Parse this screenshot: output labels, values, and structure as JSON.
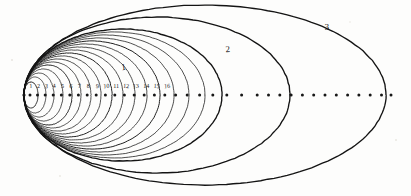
{
  "figure": {
    "background_color": "#fdfdfc",
    "ink_color": "#141414",
    "width": 411,
    "height": 196
  },
  "focus": {
    "label": "common-focus",
    "x": 24,
    "y": 95
  },
  "axis": {
    "label": "major-axis",
    "y": 95,
    "start_x": 24,
    "end_x": 392,
    "dot_radius": 1.5,
    "dot_positions": [
      30,
      37.5,
      45.2,
      53.2,
      61.4,
      69.8,
      78.4,
      87.2,
      96.2,
      105.4,
      114.8,
      124.4,
      134.2,
      144.2,
      154.4,
      164.8,
      175.6,
      187.2,
      199.6,
      212.8,
      226.8,
      241.6,
      257.2,
      268.5,
      279.8,
      291.1,
      302.4,
      313.7,
      325.0,
      336.3,
      347.6,
      358.9,
      370.2,
      381.5,
      391.0
    ]
  },
  "tick_numbers": {
    "label": "axis-tick-numbers",
    "y": 88,
    "items": [
      {
        "text": "1",
        "x": 31.0
      },
      {
        "text": "2",
        "x": 38.4
      },
      {
        "text": "3",
        "x": 46.2
      },
      {
        "text": "4",
        "x": 54.2
      },
      {
        "text": "5",
        "x": 62.4
      },
      {
        "text": "6",
        "x": 70.8
      },
      {
        "text": "7",
        "x": 79.4
      },
      {
        "text": "8",
        "x": 88.2
      },
      {
        "text": "9",
        "x": 97.2
      },
      {
        "text": "10",
        "x": 106.6
      },
      {
        "text": "11",
        "x": 116.2
      },
      {
        "text": "12",
        "x": 126.0
      },
      {
        "text": "13",
        "x": 136.0
      },
      {
        "text": "14",
        "x": 146.2
      },
      {
        "text": "15",
        "x": 156.6
      },
      {
        "text": "16",
        "x": 167.2
      }
    ]
  },
  "curve_labels": {
    "label": "curve-annotations",
    "items": [
      {
        "text": "1",
        "x": 124,
        "y": 70,
        "name": "curve-label-1"
      },
      {
        "text": "2",
        "x": 228,
        "y": 52,
        "name": "curve-label-2"
      },
      {
        "text": "3",
        "x": 327,
        "y": 30,
        "name": "curve-label-3"
      }
    ]
  },
  "chart_data": {
    "type": "line",
    "xlabel": "",
    "ylabel": "",
    "grid": false,
    "legend": "none",
    "xlim": [
      0,
      411
    ],
    "ylim": [
      0,
      196
    ],
    "note": "Each ellipse shares the left focus at x=24, y=95. Semi-major axis a grows with index; right apsis equals the listed apoapsis_x.",
    "series": [
      {
        "name": "inner-orbit-1",
        "apoapsis_x": 38,
        "semi_minor": 13
      },
      {
        "name": "inner-orbit-2",
        "apoapsis_x": 46,
        "semi_minor": 18
      },
      {
        "name": "inner-orbit-3",
        "apoapsis_x": 54,
        "semi_minor": 22
      },
      {
        "name": "inner-orbit-4",
        "apoapsis_x": 63,
        "semi_minor": 26
      },
      {
        "name": "inner-orbit-5",
        "apoapsis_x": 72,
        "semi_minor": 30
      },
      {
        "name": "inner-orbit-6",
        "apoapsis_x": 81,
        "semi_minor": 33
      },
      {
        "name": "inner-orbit-7",
        "apoapsis_x": 91,
        "semi_minor": 36
      },
      {
        "name": "inner-orbit-8",
        "apoapsis_x": 101,
        "semi_minor": 39
      },
      {
        "name": "inner-orbit-9",
        "apoapsis_x": 112,
        "semi_minor": 42
      },
      {
        "name": "inner-orbit-10",
        "apoapsis_x": 123,
        "semi_minor": 45
      },
      {
        "name": "inner-orbit-11",
        "apoapsis_x": 135,
        "semi_minor": 48
      },
      {
        "name": "inner-orbit-12",
        "apoapsis_x": 147,
        "semi_minor": 51
      },
      {
        "name": "inner-orbit-13",
        "apoapsis_x": 160,
        "semi_minor": 54
      },
      {
        "name": "inner-orbit-14",
        "apoapsis_x": 174,
        "semi_minor": 57
      },
      {
        "name": "inner-orbit-15",
        "apoapsis_x": 189,
        "semi_minor": 60
      },
      {
        "name": "inner-orbit-16",
        "apoapsis_x": 205,
        "semi_minor": 63
      },
      {
        "name": "labelled-orbit-1",
        "apoapsis_x": 222,
        "semi_minor": 66
      },
      {
        "name": "labelled-orbit-2",
        "apoapsis_x": 290,
        "semi_minor": 78
      },
      {
        "name": "labelled-orbit-3",
        "apoapsis_x": 386,
        "semi_minor": 90
      }
    ]
  }
}
